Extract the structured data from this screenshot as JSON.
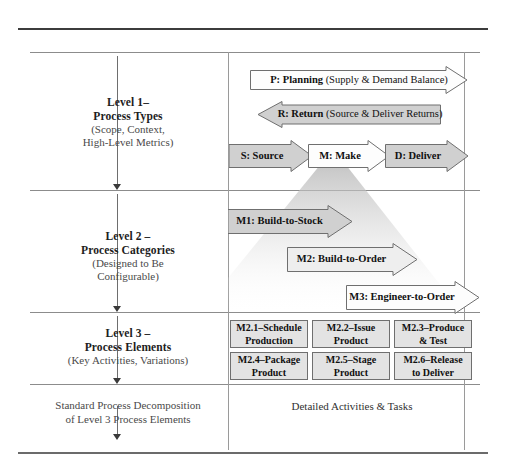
{
  "figure": {
    "colors": {
      "arrow_gray_fill": "#d0d0d0",
      "arrow_white_fill": "#fdfdfd",
      "arrow_stroke": "#6f6f6f",
      "box_fill": "#e3e3e3",
      "box_stroke": "#6f6f6f",
      "rule_color": "#8c8c8c",
      "frame_color": "#3c3c3c",
      "text_color": "#1d1d1d",
      "muted_text_color": "#4a4a4a"
    }
  },
  "levels": [
    {
      "id": "level-1",
      "title_line1": "Level 1–",
      "title_line2": "Process Types",
      "subtitle_line1": "(Scope, Context,",
      "subtitle_line2": "High-Level Metrics)"
    },
    {
      "id": "level-2",
      "title_line1": "Level 2 –",
      "title_line2": "Process Categories",
      "subtitle_line1": "(Designed to Be",
      "subtitle_line2": "Configurable)"
    },
    {
      "id": "level-3",
      "title_line1": "Level 3 –",
      "title_line2": "Process Elements",
      "subtitle_line1": "(Key Activities, Variations)",
      "subtitle_line2": ""
    }
  ],
  "decomposition": {
    "line1": "Standard Process Decomposition",
    "line2": "of Level 3 Process Elements"
  },
  "level1_arrows": [
    {
      "id": "planning",
      "code": "P: Planning",
      "detail": " (Supply & Demand Balance)",
      "direction": "right",
      "fill": "white"
    },
    {
      "id": "return",
      "code": "R: Return",
      "detail": " (Source & Deliver Returns)",
      "direction": "left",
      "fill": "gray"
    },
    {
      "id": "source",
      "code": "S: Source",
      "detail": "",
      "direction": "right",
      "fill": "gray"
    },
    {
      "id": "make",
      "code": "M: Make",
      "detail": "",
      "direction": "right",
      "fill": "white"
    },
    {
      "id": "deliver",
      "code": "D: Deliver",
      "detail": "",
      "direction": "right",
      "fill": "gray"
    }
  ],
  "level2_arrows": [
    {
      "id": "m1",
      "code": "M1: Build-to-Stock",
      "direction": "right",
      "fill": "gray"
    },
    {
      "id": "m2",
      "code": "M2: Build-to-Order",
      "direction": "right",
      "fill": "white"
    },
    {
      "id": "m3",
      "code": "M3: Engineer-to-Order",
      "direction": "right",
      "fill": "white"
    }
  ],
  "level3_elements": [
    {
      "id": "m2-1",
      "line1": "M2.1–Schedule",
      "line2": "Production"
    },
    {
      "id": "m2-2",
      "line1": "M2.2–Issue",
      "line2": "Product"
    },
    {
      "id": "m2-3",
      "line1": "M2.3–Produce",
      "line2": "& Test"
    },
    {
      "id": "m2-4",
      "line1": "M2.4–Package",
      "line2": "Product"
    },
    {
      "id": "m2-5",
      "line1": "M2.5–Stage",
      "line2": "Product"
    },
    {
      "id": "m2-6",
      "line1": "M2.6–Release",
      "line2": "to Deliver"
    }
  ],
  "detail_section": {
    "label": "Detailed Activities & Tasks"
  }
}
